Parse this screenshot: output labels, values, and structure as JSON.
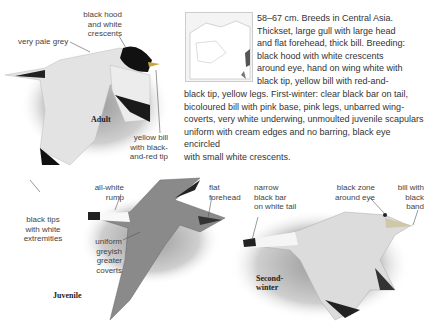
{
  "species_text": {
    "lines_narrow": [
      "58–67 cm. Breeds in Central Asia.",
      "Thickset, large gull with large head",
      "and flat forehead, thick bill. Breeding:",
      "black hood with white crescents",
      "around eye, hand on wing white with",
      "black tip, yellow bill with red-and-"
    ],
    "lines_wide": [
      "black tip, yellow legs. First-winter: clear black bar on tail,",
      "bicoloured bill with pink base, pink legs, unbarred wing-",
      "coverts, very white underwing, unmoulted juvenile scapulars",
      "uniform with cream edges and no barring, black eye encircled",
      "with small white crescents."
    ]
  },
  "map": {
    "label": "range-map",
    "range_color": "#555555"
  },
  "adult": {
    "tag": "Adult",
    "labels": {
      "hood": [
        "black hood",
        "and white",
        "crescents"
      ],
      "grey": [
        "very pale grey"
      ],
      "bill": [
        "yellow bill",
        "with black-",
        "and-red tip"
      ],
      "tips": [
        "black tips",
        "with white",
        "extremities"
      ]
    }
  },
  "juvenile": {
    "tag": "Juvenile",
    "labels": {
      "rump": [
        "all-white",
        "rump"
      ],
      "forehead": [
        "flat",
        "forehead"
      ],
      "coverts": [
        "uniform",
        "greyish",
        "greater",
        "coverts"
      ]
    }
  },
  "second_winter": {
    "tag": [
      "Second-",
      "winter"
    ],
    "labels": {
      "tail": [
        "narrow",
        "black bar",
        "on white tail"
      ],
      "eye": [
        "black zone",
        "around eye"
      ],
      "bill": [
        "bill with",
        "black",
        "band"
      ]
    }
  }
}
